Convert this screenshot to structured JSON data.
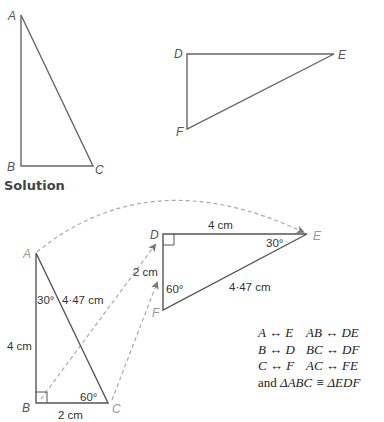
{
  "top_figure": {
    "triangle_abc": {
      "labels": {
        "A": "A",
        "B": "B",
        "C": "C"
      }
    },
    "triangle_def": {
      "labels": {
        "D": "D",
        "E": "E",
        "F": "F"
      }
    }
  },
  "heading": "Solution",
  "solution_figure": {
    "triangle_abc": {
      "labels": {
        "A": "A",
        "B": "B",
        "C": "C"
      },
      "side_ab": "4 cm",
      "side_bc": "2 cm",
      "side_ac": "4·47 cm",
      "angle_a": "30°",
      "angle_c": "60°"
    },
    "triangle_def": {
      "labels": {
        "D": "D",
        "E": "E",
        "F": "F"
      },
      "side_de": "4 cm",
      "side_df": "2 cm",
      "side_fe": "4·47 cm",
      "angle_e": "30°",
      "angle_f": "60°"
    }
  },
  "correspondence": {
    "rows": [
      {
        "vertex": "A ↔ E",
        "side": "AB ↔ DE"
      },
      {
        "vertex": "B ↔ D",
        "side": "BC ↔ DF"
      },
      {
        "vertex": "C ↔ F",
        "side": "AC ↔ FE"
      }
    ],
    "conclusion_prefix": "and ",
    "conclusion": "ΔABC ≡ ΔEDF"
  },
  "colors": {
    "triangle_stroke": "#666666",
    "dashed_arrow": "#aaaaaa",
    "text": "#333333"
  }
}
